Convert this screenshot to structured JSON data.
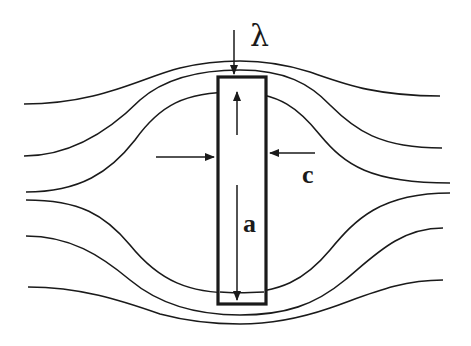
{
  "diagram": {
    "labels": {
      "lambda": "λ",
      "c": "c",
      "a": "a"
    },
    "colors": {
      "line": "#1a1a1a",
      "background": "#ffffff"
    },
    "streamlines": [
      {
        "id": "upper-outer",
        "position": "top"
      },
      {
        "id": "upper-middle",
        "position": "top"
      },
      {
        "id": "upper-inner",
        "position": "top"
      },
      {
        "id": "lower-inner",
        "position": "bottom"
      },
      {
        "id": "lower-middle",
        "position": "bottom"
      },
      {
        "id": "lower-outer",
        "position": "bottom"
      }
    ],
    "rectangle": {
      "label": "obstacle",
      "dimension_length": "a",
      "dimension_width": "c"
    }
  }
}
